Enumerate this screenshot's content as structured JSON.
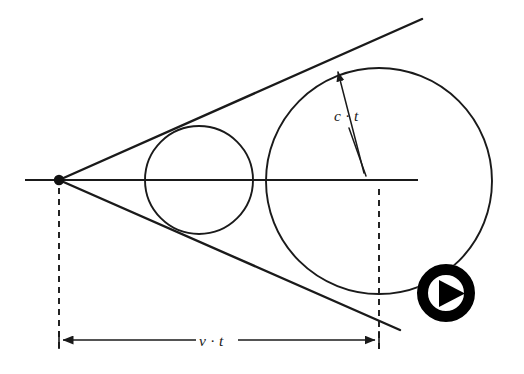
{
  "figure": {
    "background_color": "#ffffff",
    "ink_color": "#1a1a1a",
    "width": 524,
    "height": 374
  },
  "labels": {
    "speed_of_sound_distance": "c · t",
    "source_travel_distance": "v · t"
  },
  "geometry": {
    "apex": {
      "x": 59,
      "y": 180,
      "dot_radius": 5.2
    },
    "axis": {
      "x1": 25,
      "y1": 180,
      "x2": 418,
      "y2": 180
    },
    "small_circle": {
      "cx": 199,
      "cy": 180,
      "r": 54
    },
    "large_circle": {
      "cx": 379,
      "cy": 181,
      "r": 113
    },
    "upper_tangent": {
      "x1": 59,
      "y1": 180,
      "x2": 422,
      "y2": 19
    },
    "lower_tangent": {
      "x1": 59,
      "y1": 180,
      "x2": 400,
      "y2": 330
    },
    "tangent_point_large": {
      "x": 333,
      "y": 67
    },
    "dashed_left": {
      "x": 59,
      "y1": 188,
      "y2": 352
    },
    "dashed_right": {
      "x": 379,
      "y1": 189,
      "y2": 352
    },
    "dimension_line": {
      "y": 340,
      "x1": 59,
      "x2": 379
    },
    "ct_label_pos": {
      "x": 334,
      "y": 121
    },
    "vt_label_pos": {
      "x": 215,
      "y": 346
    },
    "ct_arrow_from": {
      "x": 364,
      "y": 173
    },
    "ct_arrow_to": {
      "x": 336,
      "y": 70
    }
  },
  "play_button": {
    "icon": "play-icon",
    "center_x": 446,
    "center_y": 293,
    "outer_radius": 29,
    "ring_width": 11,
    "color": "#000000",
    "inner_color": "#ffffff"
  }
}
